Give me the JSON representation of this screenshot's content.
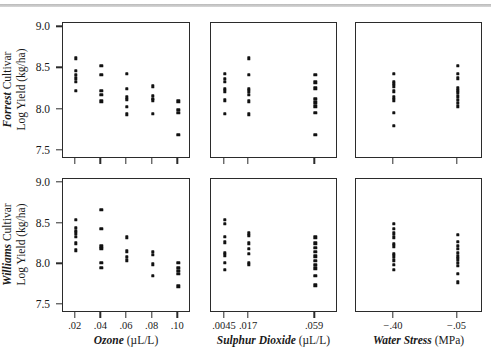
{
  "figure": {
    "type": "scatter-matrix",
    "y_axis": {
      "label_line1": "Log Yield (kg/ha)",
      "ticks": [
        "9.0",
        "8.5",
        "8.0",
        "7.5"
      ],
      "values": [
        9.0,
        8.5,
        8.0,
        7.5
      ],
      "min": 7.4,
      "max": 9.05
    },
    "rows": [
      {
        "name": "Forrest",
        "cultivar_word": "Cultivar",
        "ylabel": "Log Yield (kg/ha)"
      },
      {
        "name": "Williams",
        "cultivar_word": "Cultivar",
        "ylabel": "Log Yield (kg/ha)"
      }
    ],
    "columns": [
      {
        "name": "Ozone",
        "units": "(µL/L)",
        "tick_labels": [
          ".02",
          ".04",
          ".06",
          ".08",
          ".10"
        ],
        "tick_pos": [
          0.1,
          0.3,
          0.5,
          0.7,
          0.9
        ]
      },
      {
        "name": "Sulphur Dioxide",
        "units": "(µL/L)",
        "tick_labels": [
          ".0045",
          ".017",
          ".059"
        ],
        "tick_pos": [
          0.11,
          0.3,
          0.82
        ]
      },
      {
        "name": "Water Stress",
        "units": "(MPa)",
        "tick_labels": [
          "−.40",
          "−.05"
        ],
        "tick_pos": [
          0.3,
          0.8
        ]
      }
    ]
  },
  "chart_data": {
    "type": "scatter",
    "title": "",
    "ylabel": "Log Yield (kg/ha)",
    "ylim": [
      7.4,
      9.05
    ],
    "yticks": [
      7.5,
      8.0,
      8.5,
      9.0
    ],
    "grid": false,
    "legend": "none",
    "panels": [
      {
        "row": "Forrest Cultivar",
        "column": "Ozone",
        "xlabel": "Ozone (µL/L)",
        "xticks": [
          0.02,
          0.04,
          0.06,
          0.08,
          0.1
        ],
        "xticklabels": [
          ".02",
          ".04",
          ".06",
          ".08",
          ".10"
        ],
        "points": [
          {
            "x": 0.02,
            "y": 8.62
          },
          {
            "x": 0.02,
            "y": 8.47
          },
          {
            "x": 0.02,
            "y": 8.42
          },
          {
            "x": 0.02,
            "y": 8.38
          },
          {
            "x": 0.02,
            "y": 8.34
          },
          {
            "x": 0.02,
            "y": 8.23
          },
          {
            "x": 0.04,
            "y": 8.53
          },
          {
            "x": 0.04,
            "y": 8.42
          },
          {
            "x": 0.04,
            "y": 8.23
          },
          {
            "x": 0.04,
            "y": 8.18
          },
          {
            "x": 0.04,
            "y": 8.1
          },
          {
            "x": 0.06,
            "y": 8.43
          },
          {
            "x": 0.06,
            "y": 8.25
          },
          {
            "x": 0.06,
            "y": 8.15
          },
          {
            "x": 0.06,
            "y": 8.12
          },
          {
            "x": 0.06,
            "y": 8.03
          },
          {
            "x": 0.06,
            "y": 7.94
          },
          {
            "x": 0.08,
            "y": 8.28
          },
          {
            "x": 0.08,
            "y": 8.17
          },
          {
            "x": 0.08,
            "y": 8.13
          },
          {
            "x": 0.08,
            "y": 8.11
          },
          {
            "x": 0.08,
            "y": 7.95
          },
          {
            "x": 0.1,
            "y": 8.1
          },
          {
            "x": 0.1,
            "y": 8.0
          },
          {
            "x": 0.1,
            "y": 7.96
          },
          {
            "x": 0.1,
            "y": 7.69
          }
        ]
      },
      {
        "row": "Forrest Cultivar",
        "column": "Sulphur Dioxide",
        "xlabel": "Sulphur Dioxide (µL/L)",
        "xticks": [
          0.0045,
          0.017,
          0.059
        ],
        "xticklabels": [
          ".0045",
          ".017",
          ".059"
        ],
        "points": [
          {
            "x": 0.0045,
            "y": 8.43
          },
          {
            "x": 0.0045,
            "y": 8.37
          },
          {
            "x": 0.0045,
            "y": 8.34
          },
          {
            "x": 0.0045,
            "y": 8.25
          },
          {
            "x": 0.0045,
            "y": 8.22
          },
          {
            "x": 0.0045,
            "y": 8.11
          },
          {
            "x": 0.0045,
            "y": 7.95
          },
          {
            "x": 0.017,
            "y": 8.62
          },
          {
            "x": 0.017,
            "y": 8.42
          },
          {
            "x": 0.017,
            "y": 8.25
          },
          {
            "x": 0.017,
            "y": 8.22
          },
          {
            "x": 0.017,
            "y": 8.18
          },
          {
            "x": 0.017,
            "y": 8.1
          },
          {
            "x": 0.017,
            "y": 7.94
          },
          {
            "x": 0.059,
            "y": 8.42
          },
          {
            "x": 0.059,
            "y": 8.33
          },
          {
            "x": 0.059,
            "y": 8.26
          },
          {
            "x": 0.059,
            "y": 8.13
          },
          {
            "x": 0.059,
            "y": 8.09
          },
          {
            "x": 0.059,
            "y": 8.04
          },
          {
            "x": 0.059,
            "y": 7.96
          },
          {
            "x": 0.059,
            "y": 7.69
          }
        ]
      },
      {
        "row": "Forrest Cultivar",
        "column": "Water Stress",
        "xlabel": "Water Stress (MPa)",
        "xticks": [
          -0.4,
          -0.05
        ],
        "xticklabels": [
          "−.40",
          "−.05"
        ],
        "points": [
          {
            "x": -0.4,
            "y": 8.43
          },
          {
            "x": -0.4,
            "y": 8.34
          },
          {
            "x": -0.4,
            "y": 8.31
          },
          {
            "x": -0.4,
            "y": 8.28
          },
          {
            "x": -0.4,
            "y": 8.22
          },
          {
            "x": -0.4,
            "y": 8.15
          },
          {
            "x": -0.4,
            "y": 8.11
          },
          {
            "x": -0.4,
            "y": 7.96
          },
          {
            "x": -0.4,
            "y": 7.8
          },
          {
            "x": -0.05,
            "y": 8.53
          },
          {
            "x": -0.05,
            "y": 8.43
          },
          {
            "x": -0.05,
            "y": 8.38
          },
          {
            "x": -0.05,
            "y": 8.26
          },
          {
            "x": -0.05,
            "y": 8.23
          },
          {
            "x": -0.05,
            "y": 8.2
          },
          {
            "x": -0.05,
            "y": 8.16
          },
          {
            "x": -0.05,
            "y": 8.12
          },
          {
            "x": -0.05,
            "y": 8.08
          },
          {
            "x": -0.05,
            "y": 8.04
          }
        ]
      },
      {
        "row": "Williams Cultivar",
        "column": "Ozone",
        "xlabel": "Ozone (µL/L)",
        "xticks": [
          0.02,
          0.04,
          0.06,
          0.08,
          0.1
        ],
        "xticklabels": [
          ".02",
          ".04",
          ".06",
          ".08",
          ".10"
        ],
        "points": [
          {
            "x": 0.02,
            "y": 8.55
          },
          {
            "x": 0.02,
            "y": 8.45
          },
          {
            "x": 0.02,
            "y": 8.41
          },
          {
            "x": 0.02,
            "y": 8.38
          },
          {
            "x": 0.02,
            "y": 8.34
          },
          {
            "x": 0.02,
            "y": 8.26
          },
          {
            "x": 0.02,
            "y": 8.17
          },
          {
            "x": 0.04,
            "y": 8.67
          },
          {
            "x": 0.04,
            "y": 8.44
          },
          {
            "x": 0.04,
            "y": 8.22
          },
          {
            "x": 0.04,
            "y": 8.19
          },
          {
            "x": 0.04,
            "y": 8.02
          },
          {
            "x": 0.04,
            "y": 7.96
          },
          {
            "x": 0.06,
            "y": 8.33
          },
          {
            "x": 0.06,
            "y": 8.16
          },
          {
            "x": 0.06,
            "y": 8.09
          },
          {
            "x": 0.06,
            "y": 8.05
          },
          {
            "x": 0.08,
            "y": 8.15
          },
          {
            "x": 0.08,
            "y": 8.12
          },
          {
            "x": 0.08,
            "y": 8.0
          },
          {
            "x": 0.08,
            "y": 7.86
          },
          {
            "x": 0.1,
            "y": 8.02
          },
          {
            "x": 0.1,
            "y": 7.96
          },
          {
            "x": 0.1,
            "y": 7.92
          },
          {
            "x": 0.1,
            "y": 7.88
          },
          {
            "x": 0.1,
            "y": 7.73
          }
        ]
      },
      {
        "row": "Williams Cultivar",
        "column": "Sulphur Dioxide",
        "xlabel": "Sulphur Dioxide (µL/L)",
        "xticks": [
          0.0045,
          0.017,
          0.059
        ],
        "xticklabels": [
          ".0045",
          ".017",
          ".059"
        ],
        "points": [
          {
            "x": 0.0045,
            "y": 8.55
          },
          {
            "x": 0.0045,
            "y": 8.5
          },
          {
            "x": 0.0045,
            "y": 8.34
          },
          {
            "x": 0.0045,
            "y": 8.27
          },
          {
            "x": 0.0045,
            "y": 8.14
          },
          {
            "x": 0.0045,
            "y": 8.11
          },
          {
            "x": 0.0045,
            "y": 8.02
          },
          {
            "x": 0.0045,
            "y": 7.93
          },
          {
            "x": 0.017,
            "y": 8.38
          },
          {
            "x": 0.017,
            "y": 8.35
          },
          {
            "x": 0.017,
            "y": 8.26
          },
          {
            "x": 0.017,
            "y": 8.19
          },
          {
            "x": 0.017,
            "y": 8.13
          },
          {
            "x": 0.017,
            "y": 8.02
          },
          {
            "x": 0.017,
            "y": 7.99
          },
          {
            "x": 0.059,
            "y": 8.33
          },
          {
            "x": 0.059,
            "y": 8.26
          },
          {
            "x": 0.059,
            "y": 8.2
          },
          {
            "x": 0.059,
            "y": 8.15
          },
          {
            "x": 0.059,
            "y": 8.1
          },
          {
            "x": 0.059,
            "y": 8.04
          },
          {
            "x": 0.059,
            "y": 7.99
          },
          {
            "x": 0.059,
            "y": 7.95
          },
          {
            "x": 0.059,
            "y": 7.86
          },
          {
            "x": 0.059,
            "y": 7.74
          }
        ]
      },
      {
        "row": "Williams Cultivar",
        "column": "Water Stress",
        "xlabel": "Water Stress (MPa)",
        "xticks": [
          -0.4,
          -0.05
        ],
        "xticklabels": [
          "−.40",
          "−.05"
        ],
        "points": [
          {
            "x": -0.4,
            "y": 8.5
          },
          {
            "x": -0.4,
            "y": 8.44
          },
          {
            "x": -0.4,
            "y": 8.38
          },
          {
            "x": -0.4,
            "y": 8.33
          },
          {
            "x": -0.4,
            "y": 8.25
          },
          {
            "x": -0.4,
            "y": 8.22
          },
          {
            "x": -0.4,
            "y": 8.13
          },
          {
            "x": -0.4,
            "y": 8.1
          },
          {
            "x": -0.4,
            "y": 8.05
          },
          {
            "x": -0.4,
            "y": 7.99
          },
          {
            "x": -0.4,
            "y": 7.93
          },
          {
            "x": -0.05,
            "y": 8.36
          },
          {
            "x": -0.05,
            "y": 8.28
          },
          {
            "x": -0.05,
            "y": 8.23
          },
          {
            "x": -0.05,
            "y": 8.19
          },
          {
            "x": -0.05,
            "y": 8.14
          },
          {
            "x": -0.05,
            "y": 8.1
          },
          {
            "x": -0.05,
            "y": 8.06
          },
          {
            "x": -0.05,
            "y": 8.02
          },
          {
            "x": -0.05,
            "y": 7.98
          },
          {
            "x": -0.05,
            "y": 7.88
          },
          {
            "x": -0.05,
            "y": 7.78
          }
        ]
      }
    ]
  }
}
